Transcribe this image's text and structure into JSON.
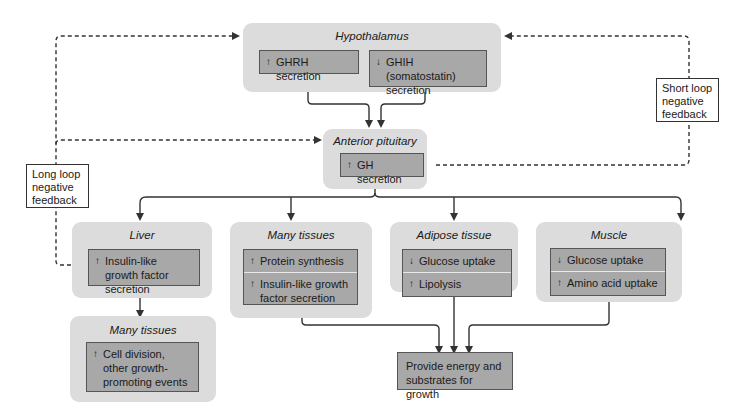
{
  "hypothalamus": {
    "title": "Hypothalamus",
    "ghrh": {
      "arrow": "↑",
      "text": "GHRH secretion"
    },
    "ghih": {
      "arrow": "↓",
      "text": "GHIH (somatostatin) secretion"
    }
  },
  "pituitary": {
    "title": "Anterior pituitary",
    "gh": {
      "arrow": "↑",
      "text": "GH secretion"
    }
  },
  "liver": {
    "title": "Liver",
    "igf": {
      "arrow": "↑",
      "text": "Insulin-like growth factor secretion"
    }
  },
  "many_tissues_1": {
    "title": "Many tissues",
    "protein": {
      "arrow": "↑",
      "text": "Protein synthesis"
    },
    "igf": {
      "arrow": "↑",
      "text": "Insulin-like growth factor secretion"
    }
  },
  "adipose": {
    "title": "Adipose tissue",
    "glucose": {
      "arrow": "↓",
      "text": "Glucose uptake"
    },
    "lipolysis": {
      "arrow": "↑",
      "text": "Lipolysis"
    }
  },
  "muscle": {
    "title": "Muscle",
    "glucose": {
      "arrow": "↓",
      "text": "Glucose uptake"
    },
    "amino": {
      "arrow": "↑",
      "text": "Amino acid uptake"
    }
  },
  "many_tissues_2": {
    "title": "Many tissues",
    "cell": {
      "arrow": "↑",
      "text": "Cell division, other growth-promoting events"
    }
  },
  "outcome": {
    "text": "Provide energy and substrates for growth"
  },
  "feedback": {
    "long": "Long loop negative feedback",
    "short": "Short loop negative feedback"
  },
  "colors": {
    "group_bg": "#dcdcdc",
    "box_bg": "#a8a8a8",
    "line": "#333333"
  }
}
